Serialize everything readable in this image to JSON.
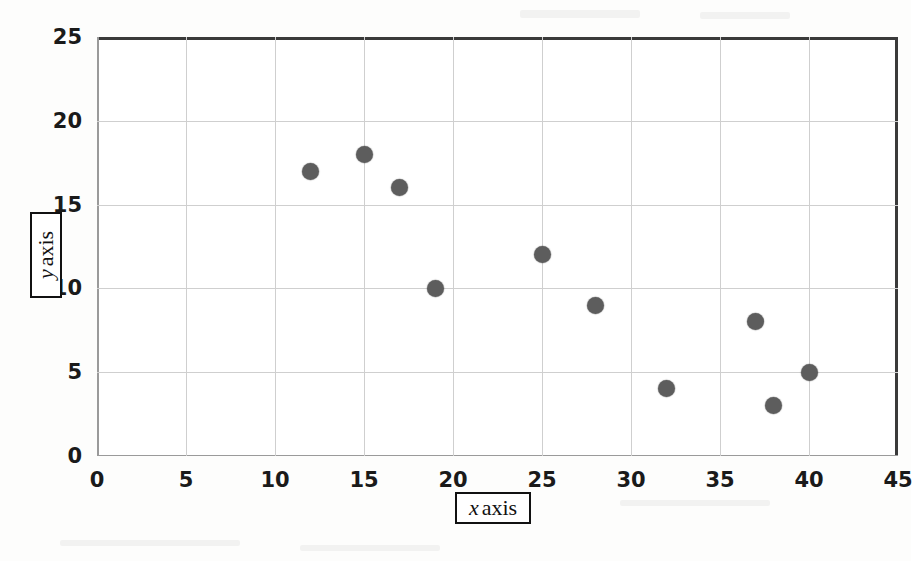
{
  "chart_data": {
    "type": "scatter",
    "title": "",
    "xlabel": "x axis",
    "ylabel": "y axis",
    "xlim": [
      0,
      45
    ],
    "ylim": [
      0,
      25
    ],
    "xticks": [
      0,
      5,
      10,
      15,
      20,
      25,
      30,
      35,
      40,
      45
    ],
    "yticks": [
      0,
      5,
      10,
      15,
      20,
      25
    ],
    "grid": true,
    "legend": false,
    "marker": {
      "shape": "circle",
      "color": "#5d5d5d",
      "size_px": 17
    },
    "series": [
      {
        "name": "series-1",
        "points": [
          {
            "x": 12,
            "y": 17
          },
          {
            "x": 15,
            "y": 18
          },
          {
            "x": 17,
            "y": 16
          },
          {
            "x": 19,
            "y": 10
          },
          {
            "x": 25,
            "y": 12
          },
          {
            "x": 28,
            "y": 9
          },
          {
            "x": 32,
            "y": 4
          },
          {
            "x": 37,
            "y": 8
          },
          {
            "x": 38,
            "y": 3
          },
          {
            "x": 40,
            "y": 5
          }
        ]
      }
    ]
  },
  "axis_titles": {
    "x": {
      "variable": "x",
      "word": "axis"
    },
    "y": {
      "variable": "y",
      "word": "axis"
    }
  },
  "colors": {
    "marker": "#5d5d5d",
    "gridline": "#cfcfcf",
    "frame_dark": "#3a3a3a",
    "frame_light": "#9a9a9a",
    "text": "#1a1a1a",
    "background": "#ffffff"
  }
}
